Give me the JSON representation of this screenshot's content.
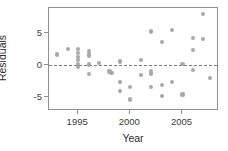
{
  "chart_data": {
    "type": "scatter",
    "title": "",
    "xlabel": "Year",
    "ylabel": "Residuals",
    "xlim": [
      1992.2,
      2008.5
    ],
    "ylim": [
      -7.2,
      9.0
    ],
    "xticks": [
      1995,
      2000,
      2005
    ],
    "xticklabels": [
      "1995",
      "2000",
      "2005"
    ],
    "yticks": [
      5,
      0,
      -5
    ],
    "yticklabels": [
      "5",
      "0",
      "-5"
    ],
    "grid": false,
    "legend": null,
    "annotations": [
      {
        "type": "hline",
        "y": 0,
        "style": "dashed",
        "color": "#7a7a7a"
      }
    ],
    "point_color": "#a8a8a8",
    "points": [
      {
        "x": 1993.0,
        "y": 1.7
      },
      {
        "x": 1994.0,
        "y": 2.5
      },
      {
        "x": 1995.0,
        "y": 2.6
      },
      {
        "x": 1995.0,
        "y": 1.9
      },
      {
        "x": 1995.0,
        "y": 1.3
      },
      {
        "x": 1995.0,
        "y": 0.8
      },
      {
        "x": 1995.0,
        "y": 0.2
      },
      {
        "x": 1995.0,
        "y": -0.3
      },
      {
        "x": 1996.0,
        "y": 2.3
      },
      {
        "x": 1996.0,
        "y": 1.7
      },
      {
        "x": 1996.0,
        "y": 1.4
      },
      {
        "x": 1996.0,
        "y": 0.1
      },
      {
        "x": 1996.0,
        "y": -1.4
      },
      {
        "x": 1997.0,
        "y": 0.3
      },
      {
        "x": 1998.0,
        "y": -1.0
      },
      {
        "x": 1998.2,
        "y": -1.2
      },
      {
        "x": 1999.0,
        "y": 0.6
      },
      {
        "x": 1999.0,
        "y": -2.6
      },
      {
        "x": 1999.0,
        "y": -4.1
      },
      {
        "x": 2000.0,
        "y": -3.4
      },
      {
        "x": 2000.0,
        "y": -5.4
      },
      {
        "x": 2001.0,
        "y": 0.8
      },
      {
        "x": 2001.0,
        "y": -1.6
      },
      {
        "x": 2002.0,
        "y": 5.3
      },
      {
        "x": 2002.0,
        "y": -0.9
      },
      {
        "x": 2002.0,
        "y": -1.3
      },
      {
        "x": 2002.0,
        "y": -3.4
      },
      {
        "x": 2003.0,
        "y": 3.6
      },
      {
        "x": 2003.0,
        "y": -3.1
      },
      {
        "x": 2003.0,
        "y": -4.8
      },
      {
        "x": 2004.0,
        "y": 5.5
      },
      {
        "x": 2004.0,
        "y": -2.7
      },
      {
        "x": 2005.0,
        "y": 0.2
      },
      {
        "x": 2005.0,
        "y": -4.6
      },
      {
        "x": 2006.0,
        "y": 4.3
      },
      {
        "x": 2006.0,
        "y": 2.4
      },
      {
        "x": 2006.0,
        "y": -0.7
      },
      {
        "x": 2007.0,
        "y": 8.1
      },
      {
        "x": 2007.0,
        "y": 4.1
      },
      {
        "x": 2007.6,
        "y": -2.0
      }
    ]
  }
}
